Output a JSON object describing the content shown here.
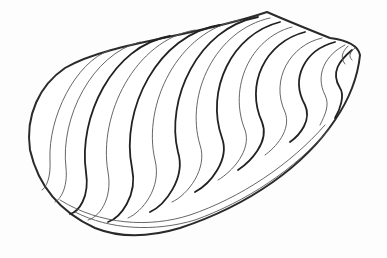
{
  "image": {
    "subject": "mussel shell line drawing",
    "background_color": "#ffffff",
    "ink_color": "#2a2a2a"
  },
  "icons": {
    "shell": "mussel-shell-illustration"
  }
}
